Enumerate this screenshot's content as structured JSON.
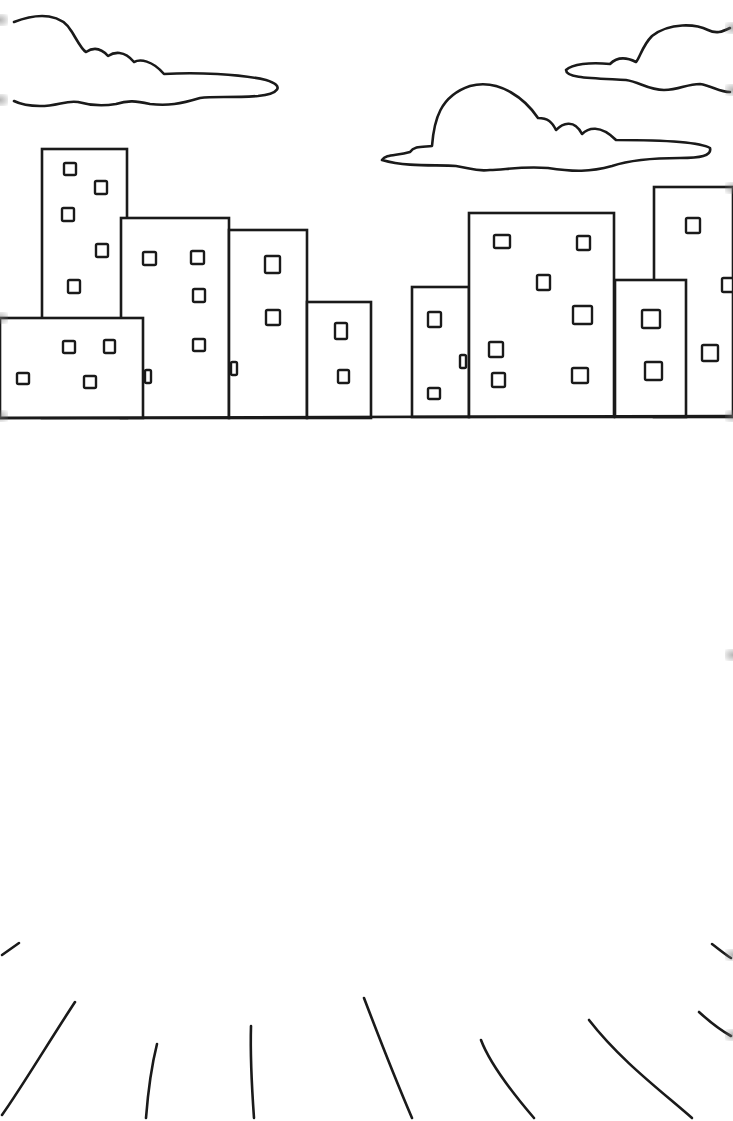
{
  "scene": {
    "description": "Coloring page: city skyline with clouds and sun rays",
    "colors": {
      "background": "#ffffff",
      "line": "#1a1a1a"
    }
  },
  "clouds": [
    {
      "name": "cloud-top-left",
      "d": "M14,22 C40,12 62,14 72,32 C78,42 82,50 86,52 C92,48 100,47 108,56 C114,52 124,50 134,62 C140,59 152,60 164,74 C196,72 240,74 266,80 C286,86 278,94 258,96 C230,98 214,96 200,98 C180,104 168,106 150,104 C136,101 128,100 116,104 C104,106 92,106 78,102 C66,100 58,106 40,106 C28,106 20,104 14,101"
    },
    {
      "name": "cloud-center",
      "d": "M382,160 C386,154 396,156 410,152 C414,146 422,147 432,146 C434,120 440,96 470,86 C500,78 526,100 538,118 C548,118 552,122 556,130 C562,124 574,118 582,134 C588,128 600,124 616,140 C660,140 700,142 710,148 C712,156 700,158 680,158 C650,158 630,160 612,166 C590,172 574,172 548,168 C520,166 504,170 490,170 C476,172 470,168 456,166 C440,164 410,168 382,160 Z"
    },
    {
      "name": "cloud-top-right",
      "d": "M730,28 C722,32 716,34 708,30 C696,24 670,22 652,36 C642,46 640,58 636,62 C628,58 618,56 610,64 C590,62 572,64 566,70 C566,78 590,78 626,80 C640,82 648,90 664,90 C680,90 686,84 700,84 C712,86 720,92 730,92"
    }
  ],
  "buildings": [
    {
      "name": "building-tall-left",
      "x": 42,
      "y": 149,
      "w": 85,
      "h": 269,
      "windows": [
        [
          64,
          163,
          12,
          12
        ],
        [
          95,
          181,
          12,
          13
        ],
        [
          62,
          208,
          12,
          13
        ],
        [
          96,
          244,
          12,
          13
        ],
        [
          68,
          280,
          12,
          13
        ]
      ]
    },
    {
      "name": "building-center-left",
      "x": 121,
      "y": 218,
      "w": 108,
      "h": 200,
      "windows": [
        [
          143,
          252,
          13,
          13
        ],
        [
          191,
          251,
          13,
          13
        ],
        [
          193,
          289,
          12,
          13
        ],
        [
          193,
          339,
          12,
          12
        ],
        [
          145,
          370,
          6,
          13
        ]
      ]
    },
    {
      "name": "building-low-left",
      "x": 0,
      "y": 318,
      "w": 143,
      "h": 100,
      "windows": [
        [
          17,
          373,
          12,
          11
        ],
        [
          63,
          341,
          12,
          12
        ],
        [
          104,
          340,
          11,
          13
        ],
        [
          84,
          376,
          12,
          12
        ]
      ]
    },
    {
      "name": "building-mid",
      "x": 229,
      "y": 230,
      "w": 78,
      "h": 188,
      "windows": [
        [
          265,
          256,
          15,
          17
        ],
        [
          266,
          310,
          14,
          15
        ],
        [
          231,
          362,
          6,
          13
        ]
      ]
    },
    {
      "name": "building-short",
      "x": 307,
      "y": 302,
      "w": 64,
      "h": 116,
      "windows": [
        [
          335,
          323,
          12,
          16
        ],
        [
          338,
          370,
          11,
          13
        ]
      ]
    },
    {
      "name": "building-narrow-right",
      "x": 412,
      "y": 287,
      "w": 57,
      "h": 130,
      "windows": [
        [
          428,
          312,
          13,
          15
        ],
        [
          428,
          388,
          12,
          11
        ],
        [
          460,
          355,
          6,
          13
        ]
      ]
    },
    {
      "name": "building-wide-right",
      "x": 469,
      "y": 213,
      "w": 145,
      "h": 204,
      "windows": [
        [
          494,
          235,
          16,
          13
        ],
        [
          577,
          236,
          13,
          14
        ],
        [
          537,
          275,
          13,
          15
        ],
        [
          573,
          306,
          19,
          18
        ],
        [
          489,
          342,
          14,
          15
        ],
        [
          492,
          373,
          13,
          14
        ],
        [
          572,
          368,
          16,
          15
        ]
      ]
    },
    {
      "name": "building-tall-right",
      "x": 654,
      "y": 187,
      "w": 79,
      "h": 230,
      "windows": [
        [
          686,
          218,
          14,
          15
        ],
        [
          722,
          278,
          11,
          14
        ],
        [
          702,
          345,
          16,
          16
        ]
      ]
    },
    {
      "name": "building-small-right",
      "x": 615,
      "y": 280,
      "w": 71,
      "h": 137,
      "windows": [
        [
          642,
          310,
          18,
          18
        ],
        [
          645,
          362,
          17,
          18
        ]
      ]
    }
  ],
  "ground": {
    "name": "ground-line",
    "x1": 0,
    "y1": 418,
    "x2": 733,
    "y2": 416
  },
  "rays": [
    {
      "name": "ray-1",
      "d": "M2,955 L19,943"
    },
    {
      "name": "ray-2",
      "d": "M75,1002 C50,1040 20,1090 2,1115"
    },
    {
      "name": "ray-3",
      "d": "M157,1044 C152,1064 148,1092 146,1118"
    },
    {
      "name": "ray-4",
      "d": "M251,1026 C250,1060 252,1090 254,1118"
    },
    {
      "name": "ray-5",
      "d": "M364,998 C380,1040 400,1090 412,1118"
    },
    {
      "name": "ray-6",
      "d": "M481,1040 C490,1064 510,1090 534,1118"
    },
    {
      "name": "ray-7",
      "d": "M589,1020 C620,1060 660,1090 692,1118"
    },
    {
      "name": "ray-8",
      "d": "M699,1012 C710,1022 720,1030 731,1036"
    },
    {
      "name": "ray-9",
      "d": "M712,944 C720,950 726,955 731,958"
    }
  ],
  "edge_marks": [
    {
      "side": "left",
      "y": 20
    },
    {
      "side": "left",
      "y": 100
    },
    {
      "side": "left",
      "y": 318
    },
    {
      "side": "left",
      "y": 416
    },
    {
      "side": "right",
      "y": 28
    },
    {
      "side": "right",
      "y": 90
    },
    {
      "side": "right",
      "y": 188
    },
    {
      "side": "right",
      "y": 416
    },
    {
      "side": "right",
      "y": 655
    },
    {
      "side": "right",
      "y": 955
    },
    {
      "side": "right",
      "y": 1035
    }
  ]
}
